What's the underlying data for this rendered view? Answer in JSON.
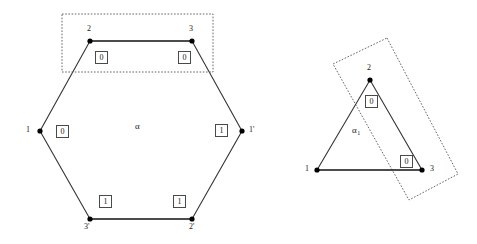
{
  "figure": {
    "stroke_color": "#333333",
    "dot_color": "#000000",
    "box_border_color": "#4a4a4a",
    "dotted_color": "#555555",
    "background": "#ffffff"
  },
  "hexagon": {
    "name": "alpha",
    "center_label": "α",
    "vertices": [
      {
        "id": "v-left",
        "label": "1",
        "x": 40,
        "y": 131
      },
      {
        "id": "v-top-left",
        "label": "2",
        "x": 90,
        "y": 41
      },
      {
        "id": "v-top-right",
        "label": "3",
        "x": 192,
        "y": 41
      },
      {
        "id": "v-right",
        "label": "1'",
        "x": 242,
        "y": 131
      },
      {
        "id": "v-bottom-right",
        "label": "2'",
        "x": 192,
        "y": 219
      },
      {
        "id": "v-bottom-left",
        "label": "3'",
        "x": 90,
        "y": 219
      }
    ],
    "edge_labels": [
      {
        "id": "edge-top-left",
        "value": "0",
        "x": 101,
        "y": 57
      },
      {
        "id": "edge-top-right",
        "value": "0",
        "x": 184,
        "y": 57
      },
      {
        "id": "edge-left",
        "value": "0",
        "x": 62,
        "y": 131
      },
      {
        "id": "edge-right",
        "value": "1",
        "x": 221,
        "y": 130
      },
      {
        "id": "edge-bottom-left",
        "value": "1",
        "x": 105,
        "y": 201
      },
      {
        "id": "edge-bottom-right",
        "value": "1",
        "x": 179,
        "y": 201
      }
    ],
    "dotted_rect": {
      "x": 62,
      "y": 14,
      "width": 151,
      "height": 58
    }
  },
  "triangle": {
    "name": "alpha-1",
    "center_label": "α",
    "center_subscript": "1",
    "vertices": [
      {
        "id": "t-left",
        "label": "1",
        "x": 317,
        "y": 170
      },
      {
        "id": "t-top",
        "label": "2",
        "x": 370,
        "y": 80
      },
      {
        "id": "t-right",
        "label": "3",
        "x": 422,
        "y": 170
      }
    ],
    "edge_labels": [
      {
        "id": "t-edge-top",
        "value": "0",
        "x": 371,
        "y": 101
      },
      {
        "id": "t-edge-right",
        "value": "0",
        "x": 406,
        "y": 161
      }
    ],
    "dotted_rect_points": "387,38 458,174 409,200 333,64"
  }
}
